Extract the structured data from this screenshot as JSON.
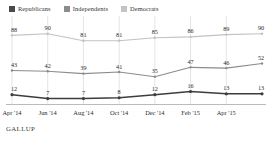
{
  "legend": {
    "items": [
      {
        "label": "Republicans",
        "color": "#4a4a4a",
        "icon": "square-swatch-icon"
      },
      {
        "label": "Independents",
        "color": "#8c8c8c",
        "icon": "square-swatch-icon"
      },
      {
        "label": "Democrats",
        "color": "#c4c4c4",
        "icon": "square-swatch-icon"
      }
    ]
  },
  "source": {
    "label": "GALLUP"
  },
  "chart_data": {
    "type": "line",
    "title": "",
    "subtitle": "",
    "xlabel": "",
    "ylabel": "",
    "grid": "vertical",
    "legend_position": "top-left",
    "ylim": [
      0,
      100
    ],
    "x": [
      "Apr '14",
      "Jun '14",
      "Aug '14",
      "Oct '14",
      "Dec '14",
      "Feb '15",
      "Apr '15",
      "Jun '15"
    ],
    "tick_labels": [
      "Apr '14",
      "Jun '14",
      "Aug '14",
      "Oct '14",
      "Dec '14",
      "Feb '15",
      "Apr '15"
    ],
    "series": [
      {
        "name": "Republicans",
        "color": "#3d3d3d",
        "values": [
          12,
          7,
          7,
          8,
          12,
          16,
          13,
          13
        ],
        "labels": [
          "12",
          "7",
          "7",
          "8",
          "12",
          "16",
          "13",
          "13"
        ]
      },
      {
        "name": "Independents",
        "color": "#8c8c8c",
        "values": [
          43,
          42,
          39,
          41,
          35,
          47,
          46,
          52
        ],
        "labels": [
          "43",
          "42",
          "39",
          "41",
          "35",
          "47",
          "46",
          "52"
        ]
      },
      {
        "name": "Democrats",
        "color": "#c2c2c2",
        "values": [
          88,
          90,
          81,
          81,
          85,
          86,
          89,
          90
        ],
        "labels": [
          "88",
          "90",
          "81",
          "81",
          "85",
          "86",
          "89",
          "90"
        ]
      }
    ]
  }
}
